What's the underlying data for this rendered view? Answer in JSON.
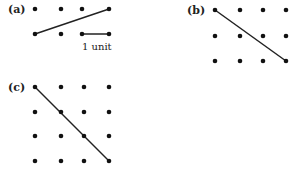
{
  "panels": [
    {
      "label": "(a)",
      "label_pos": [
        8,
        13
      ],
      "dots": [
        [
          35,
          9
        ],
        [
          61,
          9
        ],
        [
          82,
          9
        ],
        [
          109,
          9
        ],
        [
          35,
          34
        ],
        [
          61,
          34
        ],
        [
          82,
          34
        ],
        [
          109,
          34
        ]
      ],
      "lines": [
        [
          35,
          34,
          109,
          9
        ],
        [
          82,
          34,
          109,
          34
        ]
      ],
      "annotation": {
        "text": "1 unit",
        "pos": [
          82,
          50
        ]
      }
    },
    {
      "label": "(b)",
      "label_pos": [
        187,
        14
      ],
      "dots": [
        [
          215,
          10
        ],
        [
          240,
          10
        ],
        [
          263,
          10
        ],
        [
          286,
          10
        ],
        [
          215,
          36
        ],
        [
          240,
          36
        ],
        [
          263,
          36
        ],
        [
          286,
          36
        ],
        [
          215,
          61
        ],
        [
          240,
          61
        ],
        [
          263,
          61
        ],
        [
          286,
          61
        ]
      ],
      "lines": [
        [
          215,
          10,
          286,
          61
        ]
      ]
    },
    {
      "label": "(c)",
      "label_pos": [
        8,
        91
      ],
      "dots": [
        [
          35,
          87
        ],
        [
          61,
          87
        ],
        [
          84,
          87
        ],
        [
          109,
          87
        ],
        [
          35,
          112
        ],
        [
          61,
          112
        ],
        [
          84,
          112
        ],
        [
          109,
          112
        ],
        [
          35,
          136
        ],
        [
          61,
          136
        ],
        [
          84,
          136
        ],
        [
          109,
          136
        ],
        [
          35,
          161
        ],
        [
          61,
          161
        ],
        [
          84,
          161
        ],
        [
          109,
          161
        ]
      ],
      "lines": [
        [
          35,
          87,
          109,
          161
        ]
      ]
    }
  ],
  "style": {
    "dot_color": "#111111",
    "line_color": "#222222",
    "dot_radius": 2.3,
    "line_width": 1.5
  }
}
